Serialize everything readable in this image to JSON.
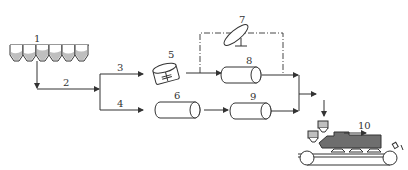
{
  "diagram": {
    "type": "process-flow",
    "labels": {
      "n1": "1",
      "n2": "2",
      "n3": "3",
      "n4": "4",
      "n5": "5",
      "n6": "6",
      "n7": "7",
      "n8": "8",
      "n9": "9",
      "n10": "10"
    },
    "colors": {
      "stroke": "#333333",
      "fill_gray": "#bfbfbf",
      "fill_dark": "#6e6e6e",
      "background": "#ffffff"
    }
  }
}
